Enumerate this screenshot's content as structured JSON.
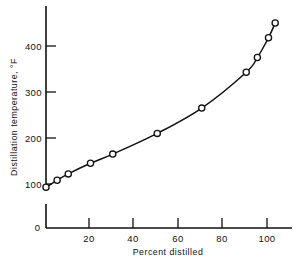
{
  "chart_data": {
    "type": "line",
    "title": "",
    "xlabel": "Percent distilled",
    "ylabel": "Distillation temperature, °F",
    "xlim": [
      0,
      105
    ],
    "ylim": [
      75,
      470
    ],
    "grid": false,
    "legend": null,
    "marker": "open-circle",
    "axis_break_y": true,
    "y_origin_label": "0",
    "xticks": [
      20,
      40,
      60,
      80,
      100
    ],
    "xticklabels": [
      "20",
      "40",
      "60",
      "80",
      "100"
    ],
    "yticks": [
      100,
      200,
      300,
      400
    ],
    "yticklabels": [
      "100",
      "200",
      "300",
      "400"
    ],
    "x": [
      0,
      5,
      10,
      20,
      30,
      50,
      70,
      90,
      95,
      100,
      103
    ],
    "values": [
      93,
      108,
      122,
      145,
      165,
      210,
      265,
      343,
      375,
      418,
      450
    ],
    "points": [
      {
        "x": 0,
        "y": 93
      },
      {
        "x": 5,
        "y": 108
      },
      {
        "x": 10,
        "y": 122
      },
      {
        "x": 20,
        "y": 145
      },
      {
        "x": 30,
        "y": 165
      },
      {
        "x": 50,
        "y": 210
      },
      {
        "x": 70,
        "y": 265
      },
      {
        "x": 90,
        "y": 343
      },
      {
        "x": 95,
        "y": 375
      },
      {
        "x": 100,
        "y": 418
      },
      {
        "x": 103,
        "y": 450
      }
    ],
    "colors": {
      "line": "#111111",
      "marker_fill": "#ffffff",
      "marker_stroke": "#111111",
      "axis": "#111111",
      "background": "#ffffff"
    }
  }
}
